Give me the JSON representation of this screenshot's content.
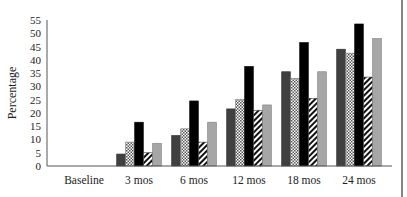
{
  "chart_data": {
    "type": "bar",
    "title": "",
    "xlabel": "",
    "ylabel": "Percentage",
    "ylim": [
      0,
      55
    ],
    "yticks": [
      0,
      5,
      10,
      15,
      20,
      25,
      30,
      35,
      40,
      45,
      50,
      55
    ],
    "grid": false,
    "legend": "none",
    "categories": [
      "Baseline",
      "3 mos",
      "6 mos",
      "12 mos",
      "18 mos",
      "24 mos"
    ],
    "series": [
      {
        "name": "Series 1",
        "fill": "#404040",
        "pattern": "solid-dark-grey",
        "values": [
          0,
          4.5,
          11.5,
          21.5,
          35.5,
          44
        ]
      },
      {
        "name": "Series 2",
        "fill": "#d9d9d9",
        "pattern": "checkered",
        "values": [
          0,
          9,
          14,
          25,
          33,
          42.5
        ]
      },
      {
        "name": "Series 3",
        "fill": "#000000",
        "pattern": "solid-black",
        "values": [
          0,
          16.5,
          24.5,
          37.5,
          46.5,
          53.5
        ]
      },
      {
        "name": "Series 4",
        "fill": "#ffffff",
        "pattern": "diagonal-stripes",
        "values": [
          0,
          5,
          9,
          21,
          25.5,
          33.5
        ]
      },
      {
        "name": "Series 5",
        "fill": "#a6a6a6",
        "pattern": "solid-light-grey",
        "values": [
          0,
          8.5,
          16.5,
          23,
          35.5,
          48
        ]
      }
    ]
  }
}
